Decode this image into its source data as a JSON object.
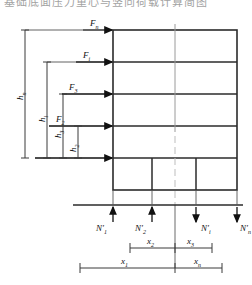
{
  "figure": {
    "title_fragment": "基础底面压力重心与竖向荷载计算简图",
    "type": "structural-frame-loading-diagram"
  },
  "lateral_forces": [
    {
      "name": "F-n",
      "base": "F",
      "sub": "n"
    },
    {
      "name": "F-i",
      "base": "F",
      "sub": "i"
    },
    {
      "name": "F-3",
      "base": "F",
      "sub": "3"
    },
    {
      "name": "F-2",
      "base": "F",
      "sub": "2"
    }
  ],
  "heights": [
    {
      "name": "h-n",
      "base": "h",
      "sub": "n"
    },
    {
      "name": "h-i",
      "base": "h",
      "sub": "i"
    },
    {
      "name": "h-3",
      "base": "h",
      "sub": "3"
    },
    {
      "name": "h-2",
      "base": "h",
      "sub": "2"
    }
  ],
  "reactions": [
    {
      "name": "N-1",
      "base": "N",
      "prime": "′",
      "sub": "1",
      "direction": "up"
    },
    {
      "name": "N-2",
      "base": "N",
      "prime": "′",
      "sub": "2",
      "direction": "up"
    },
    {
      "name": "N-i",
      "base": "N",
      "prime": "′",
      "sub": "i",
      "direction": "down"
    },
    {
      "name": "N-n",
      "base": "N",
      "prime": "′",
      "sub": "n",
      "direction": "down"
    }
  ],
  "distances_inner": [
    {
      "name": "x-2",
      "base": "x",
      "sub": "2"
    },
    {
      "name": "x-3",
      "base": "x",
      "sub": "3"
    }
  ],
  "distances_outer": [
    {
      "name": "x-1",
      "base": "x",
      "sub": "1"
    },
    {
      "name": "x-n",
      "base": "x",
      "sub": "n"
    }
  ],
  "colors": {
    "line": "#1a1a1a",
    "frame": "#2b2b2b",
    "dimension": "#3a3a3a",
    "centerline": "#9a9a9a",
    "background": "#ffffff"
  }
}
